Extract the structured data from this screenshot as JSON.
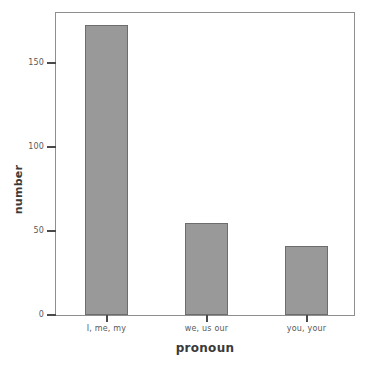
{
  "chart_data": {
    "type": "bar",
    "title": "",
    "xlabel": "pronoun",
    "ylabel": "number",
    "categories": [
      "I, me, my",
      "we, us our",
      "you, your"
    ],
    "values": [
      173,
      55,
      41
    ],
    "series": [
      {
        "name": "number",
        "values": [
          173,
          55,
          41
        ]
      }
    ],
    "ylim": [
      0,
      180
    ],
    "yticks": [
      0,
      50,
      100,
      150
    ],
    "ytick_labels": [
      "0",
      "50",
      "100",
      "150"
    ],
    "grid": false,
    "legend": false,
    "legend_position": "none",
    "bar_color": "#999999",
    "bar_edge_color": "#6d6d6d",
    "frame_color": "#8e8e8e",
    "text_color": "#5a5a5a",
    "axis_title_color": "#3a3a3a"
  },
  "figure": {
    "caption": ""
  }
}
